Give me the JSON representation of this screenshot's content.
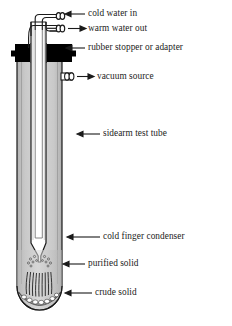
{
  "diagram": {
    "colors": {
      "outline": "#1a1a1a",
      "glass_fill": "#c2c2c2",
      "glass_fill_light": "#d4d4d4",
      "stopper": "#000000",
      "cold_finger_fill": "#ffffff",
      "crude_solid": "#9a9a9a",
      "label_text": "#1c1c1c",
      "background": "#ffffff"
    },
    "labels": [
      {
        "id": "cold-water-in",
        "text": "cold water in",
        "x": 88,
        "y": 11,
        "arrow": "left",
        "arrow_x1": 85,
        "arrow_x2": 62,
        "arrow_y": 14
      },
      {
        "id": "warm-water-out",
        "text": "warm water out",
        "x": 88,
        "y": 25,
        "arrow": "right",
        "arrow_x1": 68,
        "arrow_x2": 85,
        "arrow_y": 28
      },
      {
        "id": "rubber-stopper",
        "text": "rubber stopper or adapter",
        "x": 88,
        "y": 44,
        "arrow": "left",
        "arrow_x1": 85,
        "arrow_x2": 64,
        "arrow_y": 47
      },
      {
        "id": "vacuum-source",
        "text": "vacuum source",
        "x": 97,
        "y": 74,
        "arrow": "right",
        "arrow_x1": 77,
        "arrow_x2": 94,
        "arrow_y": 77
      },
      {
        "id": "sidearm-test-tube",
        "text": "sidearm test tube",
        "x": 103,
        "y": 131,
        "arrow": "left",
        "arrow_x1": 100,
        "arrow_x2": 76,
        "arrow_y": 134
      },
      {
        "id": "cold-finger-condenser",
        "text": "cold finger condenser",
        "x": 103,
        "y": 234,
        "arrow": "left",
        "arrow_x1": 100,
        "arrow_x2": 66,
        "arrow_y": 237
      },
      {
        "id": "purified-solid",
        "text": "purified solid",
        "x": 88,
        "y": 261,
        "arrow": "left",
        "arrow_x1": 85,
        "arrow_x2": 62,
        "arrow_y": 264
      },
      {
        "id": "crude-solid",
        "text": "crude solid",
        "x": 95,
        "y": 290,
        "arrow": "left",
        "arrow_x1": 92,
        "arrow_x2": 64,
        "arrow_y": 293
      }
    ],
    "parts": {
      "test_tube": "sidearm test tube",
      "stopper": "rubber stopper or adapter",
      "cold_finger": "cold finger condenser",
      "sidearm": "vacuum source sidearm",
      "inlet_tube": "cold water inlet tubing",
      "outlet_tube": "warm water outlet tubing",
      "crystals": "sublimed purified crystals",
      "residue": "crude solid residue"
    }
  }
}
